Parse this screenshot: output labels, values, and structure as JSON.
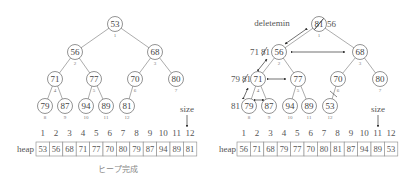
{
  "left_panel": {
    "caption": "ヒープ完成",
    "size_label": "size",
    "size_index": 12,
    "heap_label": "heap",
    "indices": [
      "1",
      "2",
      "3",
      "4",
      "5",
      "6",
      "7",
      "8",
      "9",
      "10",
      "11",
      "12"
    ],
    "heap": [
      "53",
      "56",
      "68",
      "71",
      "77",
      "70",
      "80",
      "79",
      "87",
      "94",
      "89",
      "81"
    ],
    "nodes": [
      {
        "v": "53",
        "i": "1"
      },
      {
        "v": "56",
        "i": "2"
      },
      {
        "v": "68",
        "i": "3"
      },
      {
        "v": "71",
        "i": "4"
      },
      {
        "v": "77",
        "i": "5"
      },
      {
        "v": "70",
        "i": "6"
      },
      {
        "v": "80",
        "i": "7"
      },
      {
        "v": "79",
        "i": "8"
      },
      {
        "v": "87",
        "i": "9"
      },
      {
        "v": "94",
        "i": "10"
      },
      {
        "v": "89",
        "i": "11"
      },
      {
        "v": "81",
        "i": "12"
      }
    ]
  },
  "right_panel": {
    "operation_label": "deletemin",
    "root_old": "81",
    "root_new": "56",
    "swap_labels": [
      {
        "old": "71",
        "new": "81"
      },
      {
        "old": "79",
        "new": "81"
      },
      {
        "old": "81",
        "new": ""
      }
    ],
    "size_label": "size",
    "size_index": 11,
    "heap_label": "heap",
    "indices": [
      "1",
      "2",
      "3",
      "4",
      "5",
      "6",
      "7",
      "8",
      "9",
      "10",
      "11",
      "12"
    ],
    "heap": [
      "56",
      "71",
      "68",
      "79",
      "77",
      "70",
      "80",
      "81",
      "87",
      "94",
      "89",
      "53"
    ],
    "nodes": [
      {
        "v": "81",
        "i": "1"
      },
      {
        "v": "56",
        "i": "2"
      },
      {
        "v": "68",
        "i": "3"
      },
      {
        "v": "71",
        "i": "4"
      },
      {
        "v": "77",
        "i": "5"
      },
      {
        "v": "70",
        "i": "6"
      },
      {
        "v": "80",
        "i": "7"
      },
      {
        "v": "79",
        "i": "8"
      },
      {
        "v": "87",
        "i": "9"
      },
      {
        "v": "94",
        "i": "10"
      },
      {
        "v": "89",
        "i": "11"
      },
      {
        "v": "53",
        "i": "12"
      }
    ]
  }
}
